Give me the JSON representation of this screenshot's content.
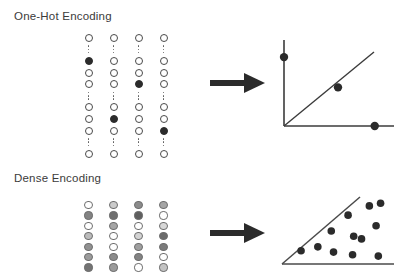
{
  "figure": {
    "width": 407,
    "height": 279,
    "background": "#ffffff",
    "ink": "#2b2b2b",
    "outline": "#4a4a4a",
    "text_color": "#3b3b3b"
  },
  "sections": [
    {
      "id": "one-hot",
      "title": "One-Hot Encoding",
      "arrow_label": "maps-to-arrow",
      "vectors": {
        "type": "one-hot-columns",
        "column_count": 4,
        "description": "four sparse vectors, each with a single active (filled) element",
        "legend": {
          "open": "zero element",
          "filled": "one / active element"
        },
        "columns": [
          {
            "index": 0,
            "cells": [
              "open",
              "gap",
              "filled",
              "open",
              "open",
              "gap",
              "open",
              "open",
              "open",
              "gap",
              "open"
            ],
            "hot_position": 2
          },
          {
            "index": 1,
            "cells": [
              "open",
              "gap",
              "open",
              "open",
              "open",
              "gap",
              "open",
              "filled",
              "open",
              "gap",
              "open"
            ],
            "hot_position": 7
          },
          {
            "index": 2,
            "cells": [
              "open",
              "gap",
              "open",
              "open",
              "filled",
              "gap",
              "open",
              "open",
              "open",
              "gap",
              "open"
            ],
            "hot_position": 4
          },
          {
            "index": 3,
            "cells": [
              "open",
              "gap",
              "open",
              "open",
              "open",
              "gap",
              "open",
              "open",
              "filled",
              "gap",
              "open"
            ],
            "hot_position": 8
          }
        ]
      },
      "plot": {
        "type": "scatter",
        "title": "",
        "xlabel": "",
        "ylabel": "",
        "axes": "two-axis-corner",
        "grid": false,
        "legend": false,
        "diagonal_line": true,
        "points": [
          {
            "x": 0.0,
            "y": 0.82
          },
          {
            "x": 0.5,
            "y": 0.46
          },
          {
            "x": 0.84,
            "y": 0.0
          }
        ],
        "xlim": [
          0,
          1
        ],
        "ylim": [
          0,
          1
        ]
      }
    },
    {
      "id": "dense",
      "title": "Dense Encoding",
      "arrow_label": "maps-to-arrow",
      "vectors": {
        "type": "dense-columns",
        "column_count": 4,
        "row_count": 7,
        "description": "four dense vectors; each element holds a continuous value shown as a gray level",
        "legend": {
          "white": "low value",
          "dark": "high value"
        },
        "columns": [
          {
            "index": 0,
            "values": [
              0.0,
              0.62,
              0.0,
              0.34,
              0.55,
              0.5,
              0.7
            ]
          },
          {
            "index": 1,
            "values": [
              0.26,
              0.72,
              0.45,
              0.0,
              0.0,
              0.58,
              0.5
            ]
          },
          {
            "index": 2,
            "values": [
              0.58,
              0.8,
              0.0,
              0.22,
              0.48,
              0.62,
              0.0
            ]
          },
          {
            "index": 3,
            "values": [
              0.45,
              0.0,
              0.2,
              0.74,
              0.66,
              0.0,
              0.3
            ]
          }
        ]
      },
      "plot": {
        "type": "scatter",
        "title": "",
        "xlabel": "",
        "ylabel": "",
        "axes": "triangle-wedge",
        "grid": false,
        "legend": false,
        "diagonal_line": true,
        "points": [
          {
            "x": 0.78,
            "y": 0.88
          },
          {
            "x": 0.88,
            "y": 0.92
          },
          {
            "x": 0.59,
            "y": 0.74
          },
          {
            "x": 0.84,
            "y": 0.58
          },
          {
            "x": 0.44,
            "y": 0.5
          },
          {
            "x": 0.64,
            "y": 0.42
          },
          {
            "x": 0.71,
            "y": 0.38
          },
          {
            "x": 0.17,
            "y": 0.2
          },
          {
            "x": 0.32,
            "y": 0.26
          },
          {
            "x": 0.46,
            "y": 0.18
          },
          {
            "x": 0.63,
            "y": 0.14
          },
          {
            "x": 0.86,
            "y": 0.12
          }
        ],
        "xlim": [
          0,
          1
        ],
        "ylim": [
          0,
          1
        ]
      }
    }
  ],
  "chart_data": [
    {
      "type": "scatter",
      "title": "One-Hot Encoding embedding space",
      "xlabel": "",
      "ylabel": "",
      "x": [
        0.0,
        0.5,
        0.84
      ],
      "y": [
        0.82,
        0.46,
        0.0
      ],
      "annotations": [
        "diagonal reference line",
        "points lie on or near the axes"
      ],
      "xlim": [
        0,
        1
      ],
      "ylim": [
        0,
        1
      ],
      "grid": false,
      "legend": null
    },
    {
      "type": "scatter",
      "title": "Dense Encoding embedding space",
      "xlabel": "",
      "ylabel": "",
      "x": [
        0.78,
        0.88,
        0.59,
        0.84,
        0.44,
        0.64,
        0.71,
        0.17,
        0.32,
        0.46,
        0.63,
        0.86
      ],
      "y": [
        0.88,
        0.92,
        0.74,
        0.58,
        0.5,
        0.42,
        0.38,
        0.2,
        0.26,
        0.18,
        0.14,
        0.12
      ],
      "annotations": [
        "triangular wedge region",
        "points scattered throughout the interior"
      ],
      "xlim": [
        0,
        1
      ],
      "ylim": [
        0,
        1
      ],
      "grid": false,
      "legend": null
    },
    {
      "type": "heatmap",
      "title": "One-Hot Encoding vectors",
      "xlabel": "",
      "ylabel": "",
      "categories": [
        "v1",
        "v2",
        "v3",
        "v4"
      ],
      "series": [
        {
          "name": "v1",
          "values": [
            0,
            1,
            0,
            0,
            0,
            0,
            0,
            0
          ]
        },
        {
          "name": "v2",
          "values": [
            0,
            0,
            0,
            0,
            0,
            1,
            0,
            0
          ]
        },
        {
          "name": "v3",
          "values": [
            0,
            0,
            0,
            1,
            0,
            0,
            0,
            0
          ]
        },
        {
          "name": "v4",
          "values": [
            0,
            0,
            0,
            0,
            0,
            0,
            1,
            0
          ]
        }
      ],
      "grid": false,
      "legend": null
    },
    {
      "type": "heatmap",
      "title": "Dense Encoding vectors",
      "xlabel": "",
      "ylabel": "",
      "categories": [
        "v1",
        "v2",
        "v3",
        "v4"
      ],
      "series": [
        {
          "name": "v1",
          "values": [
            0.0,
            0.62,
            0.0,
            0.34,
            0.55,
            0.5,
            0.7
          ]
        },
        {
          "name": "v2",
          "values": [
            0.26,
            0.72,
            0.45,
            0.0,
            0.0,
            0.58,
            0.5
          ]
        },
        {
          "name": "v3",
          "values": [
            0.58,
            0.8,
            0.0,
            0.22,
            0.48,
            0.62,
            0.0
          ]
        },
        {
          "name": "v4",
          "values": [
            0.45,
            0.0,
            0.2,
            0.74,
            0.66,
            0.0,
            0.3
          ]
        }
      ],
      "grid": false,
      "legend": null
    }
  ]
}
